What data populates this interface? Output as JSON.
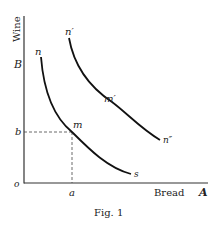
{
  "figure": {
    "caption": "Fig. 1",
    "y_axis_label": "Wine",
    "x_axis_label": "Bread",
    "x_axis_end_label": "A",
    "y_axis_top_label": "B",
    "origin_label": "o",
    "point_labels": {
      "b": "b",
      "a": "a"
    },
    "curves": [
      {
        "name": "indifference-curve-1",
        "labels": {
          "start": "n",
          "mid": "m",
          "end": "s"
        }
      },
      {
        "name": "indifference-curve-2",
        "labels": {
          "start": "n′",
          "mid": "m′",
          "end": "n″"
        }
      }
    ],
    "colors": {
      "ink": "#222222",
      "background": "#ffffff"
    }
  }
}
